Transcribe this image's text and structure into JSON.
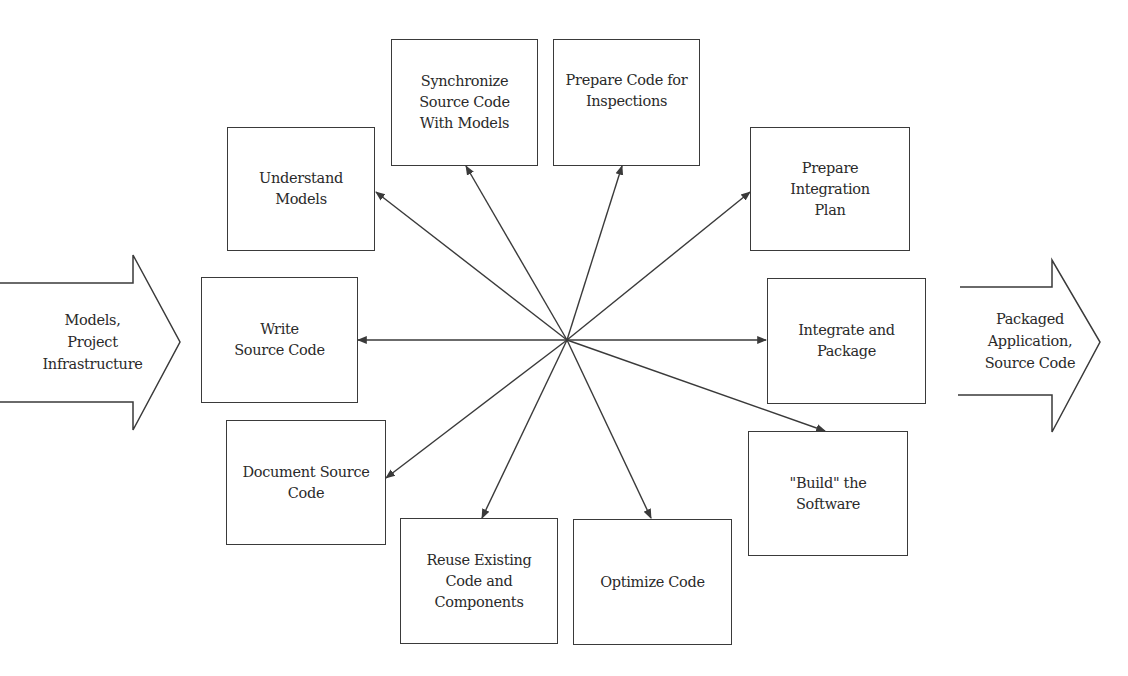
{
  "diagram": {
    "input": {
      "label": "Models,\nProject\nInfrastructure"
    },
    "output": {
      "label": "Packaged\nApplication,\nSource Code"
    },
    "center_hub": {
      "x": 567,
      "y": 340
    },
    "activities": [
      {
        "id": "understand-models",
        "label": "Understand\nModels"
      },
      {
        "id": "synchronize",
        "label": "Synchronize\nSource Code\nWith Models"
      },
      {
        "id": "prepare-inspections",
        "label": "Prepare Code for\nInspections"
      },
      {
        "id": "prepare-integration-plan",
        "label": "Prepare\nIntegration\nPlan"
      },
      {
        "id": "write-source-code",
        "label": "Write\nSource Code"
      },
      {
        "id": "integrate-package",
        "label": "Integrate and\nPackage"
      },
      {
        "id": "document-source-code",
        "label": "Document Source\nCode"
      },
      {
        "id": "build-software",
        "label": "\"Build\" the\nSoftware"
      },
      {
        "id": "reuse-existing",
        "label": "Reuse Existing\nCode and\nComponents"
      },
      {
        "id": "optimize-code",
        "label": "Optimize Code"
      }
    ],
    "colors": {
      "line": "#3a3a3a",
      "background": "#ffffff",
      "text": "#2a2a2a"
    }
  }
}
